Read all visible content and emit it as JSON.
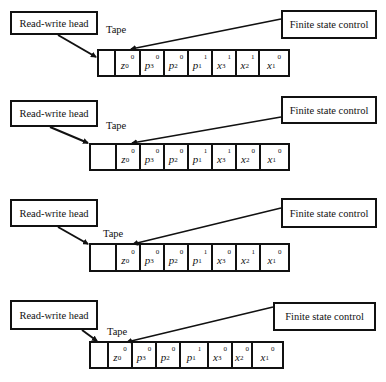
{
  "labels": {
    "read_write_head": "Read-write head",
    "finite_state_control": "Finite state control",
    "tape": "Tape"
  },
  "diagrams": [
    {
      "cells": [
        {
          "sym": "",
          "sub": "",
          "sup": ""
        },
        {
          "sym": "z",
          "sub": "0",
          "sup": "0"
        },
        {
          "sym": "p",
          "sub": "3",
          "sup": "0"
        },
        {
          "sym": "p",
          "sub": "2",
          "sup": "0"
        },
        {
          "sym": "p",
          "sub": "1",
          "sup": "1"
        },
        {
          "sym": "x",
          "sub": "3",
          "sup": "1"
        },
        {
          "sym": "x",
          "sub": "2",
          "sup": "1"
        },
        {
          "sym": "x",
          "sub": "1",
          "sup": "0"
        }
      ]
    },
    {
      "cells": [
        {
          "sym": "",
          "sub": "",
          "sup": ""
        },
        {
          "sym": "z",
          "sub": "0",
          "sup": "0"
        },
        {
          "sym": "p",
          "sub": "3",
          "sup": "0"
        },
        {
          "sym": "p",
          "sub": "2",
          "sup": "0"
        },
        {
          "sym": "p",
          "sub": "1",
          "sup": "1"
        },
        {
          "sym": "x",
          "sub": "3",
          "sup": "1"
        },
        {
          "sym": "x",
          "sub": "2",
          "sup": "0"
        },
        {
          "sym": "x",
          "sub": "1",
          "sup": "0"
        }
      ]
    },
    {
      "cells": [
        {
          "sym": "",
          "sub": "",
          "sup": ""
        },
        {
          "sym": "z",
          "sub": "0",
          "sup": "0"
        },
        {
          "sym": "p",
          "sub": "3",
          "sup": "0"
        },
        {
          "sym": "p",
          "sub": "2",
          "sup": "0"
        },
        {
          "sym": "p",
          "sub": "1",
          "sup": "1"
        },
        {
          "sym": "x",
          "sub": "3",
          "sup": "0"
        },
        {
          "sym": "x",
          "sub": "2",
          "sup": "1"
        },
        {
          "sym": "x",
          "sub": "1",
          "sup": "0"
        }
      ]
    },
    {
      "cells": [
        {
          "sym": "",
          "sub": "",
          "sup": ""
        },
        {
          "sym": "z",
          "sub": "0",
          "sup": "0"
        },
        {
          "sym": "p",
          "sub": "3",
          "sup": "0"
        },
        {
          "sym": "p",
          "sub": "2",
          "sup": "0"
        },
        {
          "sym": "p",
          "sub": "1",
          "sup": "1"
        },
        {
          "sym": "x",
          "sub": "3",
          "sup": "0"
        },
        {
          "sym": "x",
          "sub": "2",
          "sup": "0"
        },
        {
          "sym": "x",
          "sub": "1",
          "sup": "0"
        }
      ]
    }
  ]
}
